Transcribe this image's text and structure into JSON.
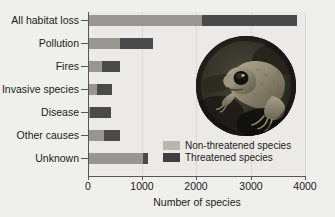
{
  "chart_data": {
    "type": "bar",
    "orientation": "horizontal",
    "stacked": true,
    "title": "",
    "xlabel": "Number of species",
    "ylabel": "",
    "xlim": [
      0,
      4000
    ],
    "xticks": [
      0,
      1000,
      2000,
      3000,
      4000
    ],
    "xticklabels": [
      "0",
      "1000",
      "2000",
      "3000",
      "4000"
    ],
    "grid": true,
    "legend_position": "inside lower right",
    "categories": [
      "All habitat loss",
      "Pollution",
      "Fires",
      "Invasive species",
      "Disease",
      "Other causes",
      "Unknown"
    ],
    "series": [
      {
        "name": "Non-threatened species",
        "color": "#999691",
        "values": [
          2100,
          590,
          260,
          165,
          30,
          290,
          1010
        ]
      },
      {
        "name": "Threatened species",
        "color": "#4a4a4a",
        "values": [
          1750,
          610,
          330,
          275,
          400,
          300,
          90
        ]
      }
    ],
    "totals": [
      3850,
      1200,
      590,
      440,
      430,
      590,
      1100
    ],
    "annotations": [
      {
        "type": "inset-image",
        "name": "toad-photo",
        "shape": "circle",
        "description": "Photograph of a toad clinging to a dark branch"
      }
    ]
  },
  "axis": {
    "x_title": "Number of species",
    "tick_labels": [
      "0",
      "1000",
      "2000",
      "3000",
      "4000"
    ]
  },
  "legend": {
    "items": [
      {
        "label": "Non-threatened species",
        "swatch": "light-gray"
      },
      {
        "label": "Threatened species",
        "swatch": "dark-gray"
      }
    ]
  },
  "colors": {
    "non_threatened": "#999691",
    "threatened": "#4a4a4a",
    "background": "#efefec",
    "plot_background": "#eceae6",
    "axis": "#555555"
  }
}
